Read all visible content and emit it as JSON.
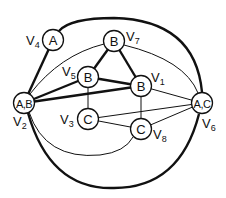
{
  "diagram": {
    "type": "graph",
    "nodes": [
      {
        "id": "V1",
        "content": "B",
        "label_main": "V",
        "label_sub": "1"
      },
      {
        "id": "V2",
        "content": "A,B",
        "label_main": "V",
        "label_sub": "2"
      },
      {
        "id": "V3",
        "content": "C",
        "label_main": "V",
        "label_sub": "3"
      },
      {
        "id": "V4",
        "content": "A",
        "label_main": "V",
        "label_sub": "4"
      },
      {
        "id": "V5",
        "content": "B",
        "label_main": "V",
        "label_sub": "5"
      },
      {
        "id": "V6",
        "content": "A,C",
        "label_main": "V",
        "label_sub": "6"
      },
      {
        "id": "V7",
        "content": "B",
        "label_main": "V",
        "label_sub": "7"
      },
      {
        "id": "V8",
        "content": "C",
        "label_main": "V",
        "label_sub": "8"
      }
    ],
    "edges": [
      {
        "from": "V4",
        "to": "V2",
        "weight": "thick"
      },
      {
        "from": "V2",
        "to": "V5",
        "weight": "thick"
      },
      {
        "from": "V2",
        "to": "V1",
        "weight": "thick"
      },
      {
        "from": "V5",
        "to": "V1",
        "weight": "thick"
      },
      {
        "from": "V5",
        "to": "V7",
        "weight": "thick"
      },
      {
        "from": "V7",
        "to": "V1",
        "weight": "thick"
      },
      {
        "from": "V4",
        "to": "V6",
        "weight": "thick",
        "style": "outer-arc-top"
      },
      {
        "from": "V2",
        "to": "V6",
        "weight": "thick",
        "style": "outer-arc-bottom"
      },
      {
        "from": "V2",
        "to": "V7",
        "weight": "thin",
        "style": "arc"
      },
      {
        "from": "V7",
        "to": "V6",
        "weight": "thin",
        "style": "arc"
      },
      {
        "from": "V2",
        "to": "V8",
        "weight": "thin",
        "style": "arc"
      },
      {
        "from": "V5",
        "to": "V3",
        "weight": "thin"
      },
      {
        "from": "V1",
        "to": "V8",
        "weight": "thin"
      },
      {
        "from": "V1",
        "to": "V6",
        "weight": "thin"
      },
      {
        "from": "V3",
        "to": "V6",
        "weight": "thin"
      },
      {
        "from": "V3",
        "to": "V8",
        "weight": "thin"
      },
      {
        "from": "V8",
        "to": "V6",
        "weight": "thin"
      }
    ]
  }
}
